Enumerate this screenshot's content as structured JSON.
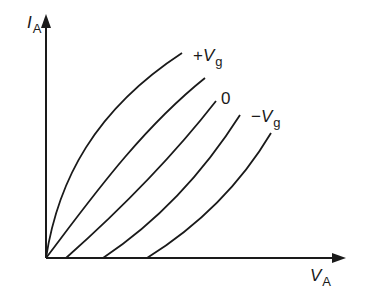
{
  "diagram": {
    "type": "characteristic-curves",
    "y_axis": {
      "symbol": "I",
      "subscript": "A"
    },
    "x_axis": {
      "symbol": "V",
      "subscript": "A"
    },
    "curve_labels": [
      {
        "sign": "+",
        "symbol": "V",
        "subscript": "g"
      },
      {
        "text": "0"
      },
      {
        "sign": "−",
        "symbol": "V",
        "subscript": "g"
      }
    ],
    "curve_count": 5,
    "line_color": "#1a1a1a"
  }
}
